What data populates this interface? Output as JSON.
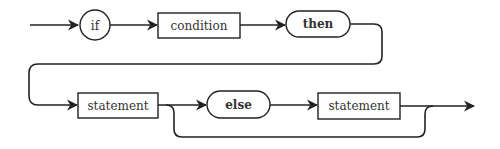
{
  "diagram": {
    "type": "syntax-diagram",
    "nodes": {
      "if": {
        "label": "if",
        "shape": "circle"
      },
      "condition": {
        "label": "condition",
        "shape": "rectangle"
      },
      "then": {
        "label": "then",
        "shape": "rounded-pill"
      },
      "statement1": {
        "label": "statement",
        "shape": "rectangle"
      },
      "else": {
        "label": "else",
        "shape": "rounded-pill"
      },
      "statement2": {
        "label": "statement",
        "shape": "rectangle"
      }
    },
    "edges": [
      {
        "from": "entry",
        "to": "if"
      },
      {
        "from": "if",
        "to": "condition"
      },
      {
        "from": "condition",
        "to": "then"
      },
      {
        "from": "then",
        "to": "statement1"
      },
      {
        "from": "statement1",
        "to": "else"
      },
      {
        "from": "else",
        "to": "statement2"
      },
      {
        "from": "statement2",
        "to": "exit"
      },
      {
        "from": "statement1",
        "to": "exit",
        "note": "bypass (else optional)"
      }
    ],
    "colors": {
      "stroke": "#222222",
      "text": "#333333",
      "background": "#ffffff"
    }
  }
}
